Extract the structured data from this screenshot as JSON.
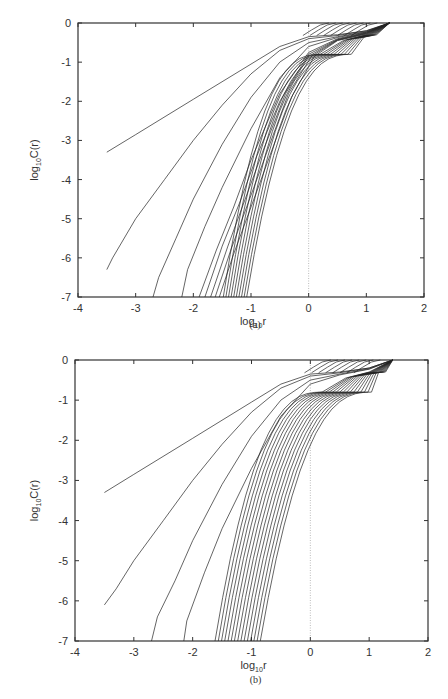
{
  "chart_data": [
    {
      "type": "line",
      "panel_label": "(a)",
      "xlabel": "log10 r",
      "ylabel": "log10 C(r)",
      "xlim": [
        -4,
        2
      ],
      "ylim": [
        -7,
        0
      ],
      "xticks": [
        "-4",
        "-3",
        "-2",
        "-1",
        "0",
        "1",
        "2"
      ],
      "yticks": [
        "0",
        "-1",
        "-2",
        "-3",
        "-4",
        "-5",
        "-6",
        "-7"
      ],
      "reference_line": {
        "x": 0,
        "style": "dotted"
      },
      "series_count": 19,
      "series": [
        {
          "name": "curve 1",
          "x": [
            -3.5,
            -3.0,
            -2.0,
            -1.0,
            -0.5,
            0.0,
            0.5,
            1.0,
            1.4
          ],
          "y": [
            -3.3,
            -2.85,
            -1.95,
            -1.05,
            -0.6,
            -0.35,
            -0.3,
            -0.2,
            0.0
          ]
        },
        {
          "name": "curve 2",
          "x": [
            -3.5,
            -3.4,
            -3.0,
            -2.5,
            -2.0,
            -1.5,
            -1.0,
            -0.5,
            0.0,
            0.5,
            1.0,
            1.4
          ],
          "y": [
            -6.3,
            -6.0,
            -5.0,
            -4.0,
            -3.0,
            -2.1,
            -1.3,
            -0.7,
            -0.4,
            -0.32,
            -0.2,
            0.0
          ]
        },
        {
          "name": "curve 3",
          "x": [
            -2.7,
            -2.6,
            -2.3,
            -2.0,
            -1.5,
            -1.0,
            -0.5,
            0.0,
            0.5,
            1.0,
            1.4
          ],
          "y": [
            -7.0,
            -6.5,
            -5.5,
            -4.5,
            -3.1,
            -1.9,
            -1.0,
            -0.5,
            -0.35,
            -0.22,
            0.0
          ]
        },
        {
          "name": "curve 4",
          "x": [
            -2.2,
            -2.1,
            -1.8,
            -1.5,
            -1.0,
            -0.5,
            0.0,
            0.5,
            1.0,
            1.4
          ],
          "y": [
            -7.0,
            -6.3,
            -5.2,
            -4.2,
            -2.7,
            -1.4,
            -0.6,
            -0.37,
            -0.23,
            0.0
          ]
        },
        {
          "name": "curve 5",
          "x": [
            -1.9,
            -1.6,
            -1.3,
            -1.0,
            -0.5,
            0.0,
            0.5,
            1.0,
            1.4
          ],
          "y": [
            -7.0,
            -5.8,
            -4.7,
            -3.5,
            -1.8,
            -0.75,
            -0.4,
            -0.24,
            0.0
          ]
        },
        {
          "name": "curve 6",
          "x": [
            -1.8,
            -1.5,
            -1.2,
            -0.9,
            -0.5,
            0.0,
            0.5,
            1.0,
            1.4
          ],
          "y": [
            -7.0,
            -5.7,
            -4.6,
            -3.4,
            -2.0,
            -0.8,
            -0.42,
            -0.25,
            0.0
          ]
        },
        {
          "name": "curve 7",
          "x": [
            -1.7,
            -1.4,
            -1.1,
            -0.8,
            -0.4,
            0.0,
            0.5,
            1.0,
            1.4
          ],
          "y": [
            -7.0,
            -5.7,
            -4.5,
            -3.3,
            -1.8,
            -0.85,
            -0.43,
            -0.26,
            0.0
          ]
        },
        {
          "name": "curve 8",
          "x": [
            -1.62,
            -1.35,
            -1.05,
            -0.75,
            -0.35,
            0.05,
            0.5,
            1.0,
            1.4
          ],
          "y": [
            -7.0,
            -5.8,
            -4.6,
            -3.4,
            -1.8,
            -0.85,
            -0.44,
            -0.27,
            0.0
          ]
        },
        {
          "name": "curve 9",
          "x": [
            -1.55,
            -1.3,
            -1.0,
            -0.7,
            -0.3,
            0.1,
            0.5,
            1.0,
            1.4
          ],
          "y": [
            -7.0,
            -5.9,
            -4.7,
            -3.5,
            -1.9,
            -0.85,
            -0.45,
            -0.28,
            0.0
          ]
        }
      ]
    },
    {
      "type": "line",
      "panel_label": "(b)",
      "xlabel": "log10 r",
      "ylabel": "log10 C(r)",
      "xlim": [
        -4,
        2
      ],
      "ylim": [
        -7,
        0
      ],
      "xticks": [
        "-4",
        "-3",
        "-2",
        "-1",
        "0",
        "1",
        "2"
      ],
      "yticks": [
        "0",
        "-1",
        "-2",
        "-3",
        "-4",
        "-5",
        "-6",
        "-7"
      ],
      "reference_line": {
        "x": 0,
        "style": "dotted"
      },
      "series_count": 19,
      "series": [
        {
          "name": "curve 1",
          "x": [
            -3.5,
            -3.0,
            -2.0,
            -1.0,
            -0.5,
            0.0,
            0.5,
            1.0,
            1.4
          ],
          "y": [
            -3.3,
            -2.85,
            -1.95,
            -1.05,
            -0.6,
            -0.35,
            -0.3,
            -0.2,
            0.0
          ]
        },
        {
          "name": "curve 2",
          "x": [
            -3.5,
            -3.3,
            -3.0,
            -2.5,
            -2.0,
            -1.5,
            -1.0,
            -0.5,
            0.0,
            0.5,
            1.0,
            1.4
          ],
          "y": [
            -6.1,
            -5.7,
            -5.0,
            -4.0,
            -3.0,
            -2.1,
            -1.3,
            -0.7,
            -0.4,
            -0.32,
            -0.2,
            0.0
          ]
        },
        {
          "name": "curve 3",
          "x": [
            -2.7,
            -2.6,
            -2.3,
            -2.0,
            -1.5,
            -1.0,
            -0.5,
            0.0,
            0.5,
            1.0,
            1.4
          ],
          "y": [
            -7.0,
            -6.4,
            -5.5,
            -4.5,
            -3.1,
            -1.9,
            -1.0,
            -0.5,
            -0.35,
            -0.22,
            0.0
          ]
        },
        {
          "name": "curve 4",
          "x": [
            -2.15,
            -2.1,
            -1.8,
            -1.5,
            -1.0,
            -0.5,
            0.0,
            0.5,
            1.0,
            1.4
          ],
          "y": [
            -7.0,
            -6.5,
            -5.3,
            -4.2,
            -2.7,
            -1.4,
            -0.6,
            -0.37,
            -0.23,
            0.0
          ]
        }
      ]
    }
  ],
  "panels": {
    "a": {
      "label": "(a)",
      "xlabel_main": "log",
      "xlabel_sub": "10",
      "xlabel_tail": "r",
      "ylabel_main": "log",
      "ylabel_sub": "10",
      "ylabel_tail": "C(r)"
    },
    "b": {
      "label": "(b)",
      "xlabel_main": "log",
      "xlabel_sub": "10",
      "xlabel_tail": "r",
      "ylabel_main": "log",
      "ylabel_sub": "10",
      "ylabel_tail": "C(r)"
    }
  },
  "colors": {
    "curve": "#222222",
    "axis": "#333333",
    "ref_line": "#aaaaaa"
  }
}
